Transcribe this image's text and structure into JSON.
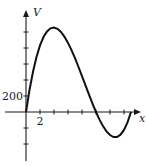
{
  "chart_data": {
    "type": "line",
    "title": "",
    "xlabel": "x",
    "ylabel": "V",
    "xlim": [
      0,
      16.5
    ],
    "ylim": [
      -400,
      1200
    ],
    "x_ticks": [
      2,
      4,
      6,
      8,
      10,
      12,
      14
    ],
    "x_tick_labels": [
      {
        "value": 2,
        "label": "2"
      }
    ],
    "y_ticks": [
      -400,
      -200,
      200,
      400,
      600,
      800,
      1000
    ],
    "y_tick_labels": [
      {
        "value": 200,
        "label": "200"
      }
    ],
    "grid": false,
    "series": [
      {
        "name": "V(x) = 4x(10 - x)(15 - x)",
        "x": [
          0,
          0.5,
          1,
          1.5,
          2,
          2.5,
          3,
          3.5,
          4,
          4.5,
          5,
          5.5,
          6,
          6.5,
          7,
          7.5,
          8,
          8.5,
          9,
          9.5,
          10,
          10.5,
          11,
          11.5,
          12,
          12.5,
          13,
          13.5,
          14,
          14.5,
          15
        ],
        "y": [
          0,
          275,
          504,
          689,
          832,
          938,
          1008,
          1046,
          1056,
          1040,
          1000,
          940,
          864,
          774,
          672,
          563,
          448,
          332,
          216,
          105,
          0,
          -95,
          -176,
          -242,
          -288,
          -313,
          -312,
          -284,
          -224,
          -130,
          0
        ]
      }
    ]
  }
}
